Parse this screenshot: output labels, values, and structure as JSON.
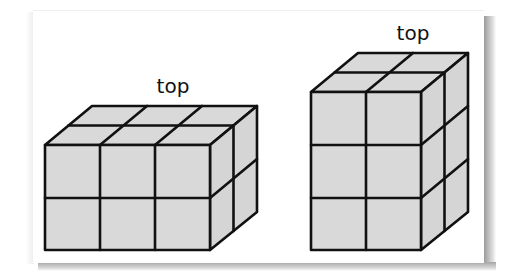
{
  "figure": {
    "colors": {
      "face_fill": "#d9d9d9",
      "side_fill": "#d4d4d4",
      "edge": "#111111",
      "card": "#ffffff"
    },
    "prisms": [
      {
        "id": "left",
        "label": "top",
        "dimensions": {
          "width": 3,
          "depth": 2,
          "height": 2
        },
        "orientation": "lying flat"
      },
      {
        "id": "right",
        "label": "top",
        "dimensions": {
          "width": 2,
          "depth": 2,
          "height": 3
        },
        "orientation": "standing upright"
      }
    ]
  }
}
